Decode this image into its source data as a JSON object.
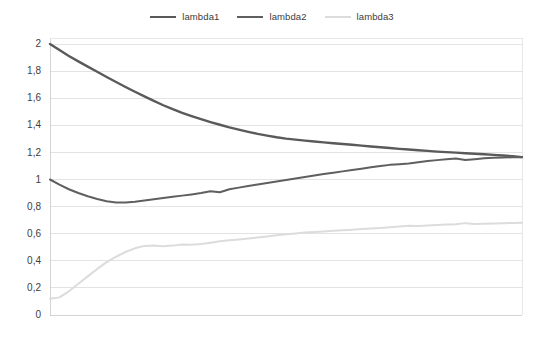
{
  "legend": {
    "position": "top-center",
    "items": [
      {
        "label": "lambda1",
        "color": "#5a5a5a",
        "width": 2.4
      },
      {
        "label": "lambda2",
        "color": "#5f5f5f",
        "width": 2.0
      },
      {
        "label": "lambda3",
        "color": "#dcdcdc",
        "width": 2.0
      }
    ]
  },
  "axes": {
    "y_tick_labels": [
      "2",
      "1,8",
      "1,6",
      "1,4",
      "1,2",
      "1",
      "0,8",
      "0,6",
      "0,4",
      "0,2",
      "0"
    ],
    "y_tick_values": [
      2,
      1.8,
      1.6,
      1.4,
      1.2,
      1,
      0.8,
      0.6,
      0.4,
      0.2,
      0
    ],
    "x_tick_labels": [],
    "grid": "horizontal"
  },
  "chart_data": {
    "type": "line",
    "title": "",
    "subtitle": "",
    "xlabel": "",
    "ylabel": "",
    "xlim": [
      0,
      100
    ],
    "ylim": [
      0,
      2
    ],
    "grid": true,
    "legend_position": "top-center",
    "x": [
      0,
      2,
      4,
      6,
      8,
      10,
      12,
      14,
      16,
      18,
      20,
      22,
      24,
      26,
      28,
      30,
      32,
      34,
      36,
      38,
      40,
      42,
      44,
      46,
      48,
      50,
      52,
      54,
      56,
      58,
      60,
      62,
      64,
      66,
      68,
      70,
      72,
      74,
      76,
      78,
      80,
      82,
      84,
      86,
      88,
      90,
      92,
      94,
      96,
      98,
      100
    ],
    "series": [
      {
        "name": "lambda1",
        "color": "#5a5a5a",
        "values": [
          2.0,
          1.955,
          1.912,
          1.872,
          1.833,
          1.795,
          1.757,
          1.72,
          1.683,
          1.648,
          1.614,
          1.58,
          1.548,
          1.519,
          1.492,
          1.468,
          1.445,
          1.424,
          1.404,
          1.385,
          1.368,
          1.352,
          1.337,
          1.324,
          1.312,
          1.302,
          1.294,
          1.287,
          1.28,
          1.274,
          1.268,
          1.262,
          1.256,
          1.25,
          1.244,
          1.238,
          1.232,
          1.226,
          1.221,
          1.216,
          1.211,
          1.206,
          1.202,
          1.198,
          1.194,
          1.19,
          1.186,
          1.182,
          1.177,
          1.172,
          1.165
        ]
      },
      {
        "name": "lambda2",
        "color": "#5f5f5f",
        "values": [
          1.0,
          0.962,
          0.928,
          0.9,
          0.876,
          0.856,
          0.84,
          0.831,
          0.83,
          0.836,
          0.845,
          0.854,
          0.863,
          0.872,
          0.881,
          0.89,
          0.9,
          0.913,
          0.906,
          0.928,
          0.94,
          0.952,
          0.963,
          0.974,
          0.985,
          0.996,
          1.007,
          1.018,
          1.029,
          1.04,
          1.05,
          1.06,
          1.07,
          1.08,
          1.09,
          1.1,
          1.108,
          1.113,
          1.118,
          1.127,
          1.136,
          1.143,
          1.15,
          1.155,
          1.144,
          1.15,
          1.156,
          1.16,
          1.162,
          1.164,
          1.165
        ]
      },
      {
        "name": "lambda3",
        "color": "#dcdcdc",
        "values": [
          0.12,
          0.13,
          0.175,
          0.23,
          0.285,
          0.34,
          0.39,
          0.43,
          0.465,
          0.492,
          0.51,
          0.513,
          0.508,
          0.512,
          0.52,
          0.518,
          0.524,
          0.534,
          0.545,
          0.552,
          0.558,
          0.565,
          0.572,
          0.58,
          0.588,
          0.596,
          0.602,
          0.608,
          0.612,
          0.617,
          0.622,
          0.626,
          0.63,
          0.634,
          0.638,
          0.642,
          0.648,
          0.654,
          0.658,
          0.656,
          0.66,
          0.664,
          0.667,
          0.67,
          0.678,
          0.672,
          0.674,
          0.676,
          0.678,
          0.679,
          0.68
        ]
      }
    ]
  }
}
